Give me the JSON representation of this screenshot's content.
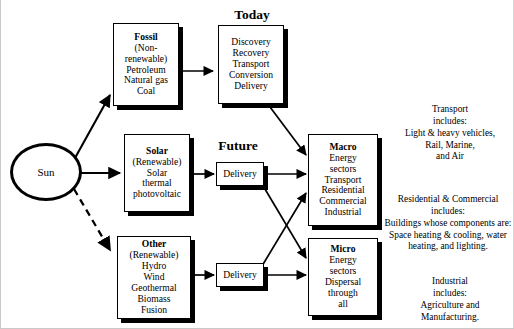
{
  "diagram": {
    "headers": {
      "today": "Today",
      "future": "Future"
    },
    "source": {
      "label": "Sun"
    },
    "sources": [
      {
        "id": "fossil",
        "title": "Fossil",
        "lines": [
          "(Non-",
          "renewable)",
          "Petroleum",
          "Natural gas",
          "Coal"
        ]
      },
      {
        "id": "solar",
        "title": "Solar",
        "lines": [
          "(Renewable)",
          "Solar",
          "thermal",
          "photovoltaic"
        ]
      },
      {
        "id": "other",
        "title": "Other",
        "lines": [
          "(Renewable)",
          "Hydro",
          "Wind",
          "Geothermal",
          "Biomass",
          "Fusion"
        ]
      }
    ],
    "processes": [
      {
        "id": "today-chain",
        "lines": [
          "Discovery",
          "Recovery",
          "Transport",
          "Conversion",
          "Delivery"
        ]
      },
      {
        "id": "future-solar-delivery",
        "lines": [
          "Delivery"
        ]
      },
      {
        "id": "future-other-delivery",
        "lines": [
          "Delivery"
        ]
      }
    ],
    "endpoints": [
      {
        "id": "macro",
        "title": "Macro",
        "lines": [
          "Energy",
          "sectors",
          "Transport",
          "Residential",
          "Commercial",
          "Industrial"
        ]
      },
      {
        "id": "micro",
        "title": "Micro",
        "lines": [
          "Energy",
          "sectors",
          "Dispersal",
          "through",
          "all"
        ]
      }
    ],
    "notes": [
      {
        "id": "transport-note",
        "lines": [
          "Transport",
          "includes:",
          "Light & heavy vehicles,",
          "Rail, Marine,",
          "and Air"
        ]
      },
      {
        "id": "residential-commercial-note",
        "lines": [
          "Residential & Commercial",
          "includes:",
          "Buildings whose components are:",
          "Space heating & cooling, water",
          "heating, and lighting."
        ]
      },
      {
        "id": "industrial-note",
        "lines": [
          "Industrial",
          "includes:",
          "Agriculture and",
          "Manufacturing."
        ]
      }
    ],
    "colors": {
      "ink": "#000000",
      "paper": "#ffffff",
      "frame": "#c9c9c9"
    }
  }
}
